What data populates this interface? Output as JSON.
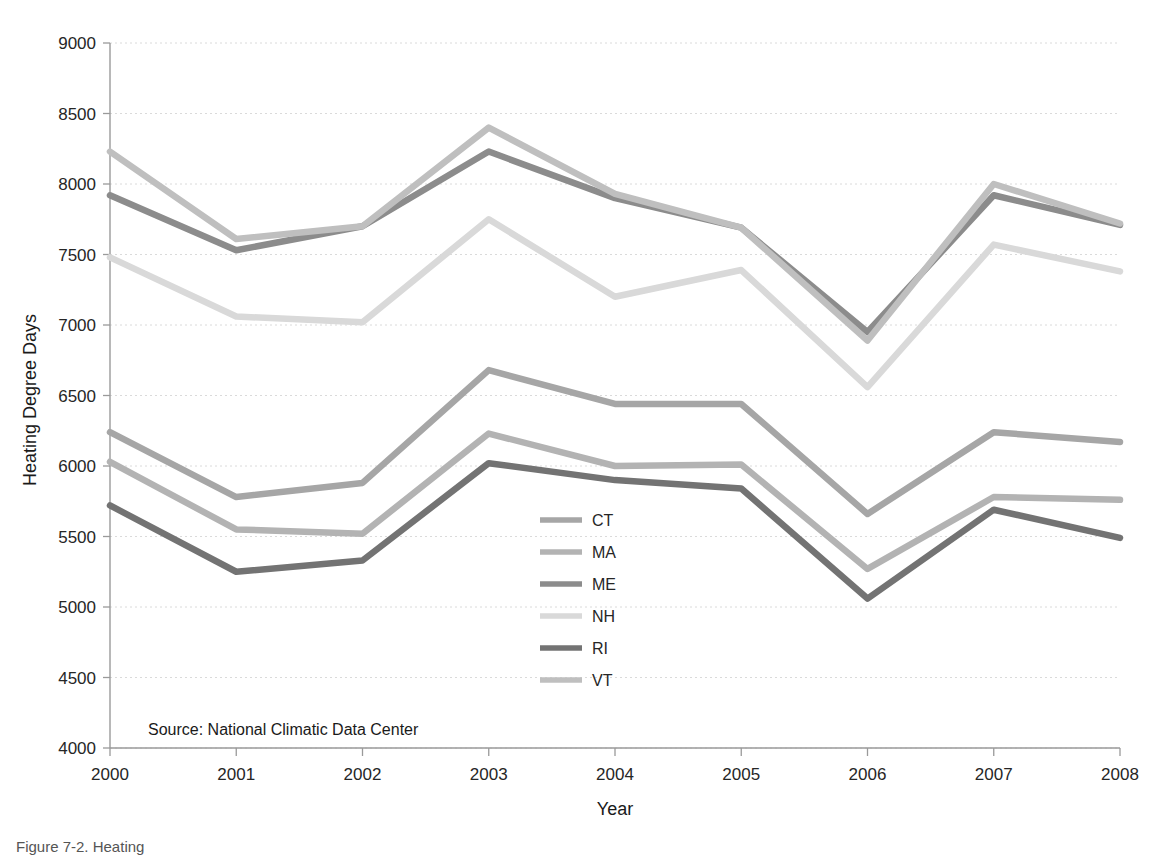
{
  "chart_data": {
    "type": "line",
    "title": "",
    "xlabel": "Year",
    "ylabel": "Heating Degree Days",
    "x": [
      2000,
      2001,
      2002,
      2003,
      2004,
      2005,
      2006,
      2007,
      2008
    ],
    "categories": [
      "2000",
      "2001",
      "2002",
      "2003",
      "2004",
      "2005",
      "2006",
      "2007",
      "2008"
    ],
    "xlim": [
      2000,
      2008
    ],
    "ylim": [
      4000,
      9000
    ],
    "yticks": [
      4000,
      4500,
      5000,
      5500,
      6000,
      6500,
      7000,
      7500,
      8000,
      8500,
      9000
    ],
    "ytick_labels": [
      "4000",
      "4500",
      "5000",
      "5500",
      "6000",
      "6500",
      "7000",
      "7500",
      "8000",
      "8500",
      "9000"
    ],
    "grid": true,
    "grid_axis": "y",
    "legend_position": "center",
    "series": [
      {
        "name": "CT",
        "color": "#a6a6a6",
        "values": [
          6240,
          5780,
          5880,
          6680,
          6440,
          6440,
          5660,
          6240,
          6170
        ]
      },
      {
        "name": "MA",
        "color": "#b3b3b3",
        "values": [
          6030,
          5550,
          5520,
          6230,
          6000,
          6010,
          5270,
          5780,
          5760
        ]
      },
      {
        "name": "ME",
        "color": "#8c8c8c",
        "values": [
          7920,
          7530,
          7700,
          8230,
          7900,
          7690,
          6950,
          7920,
          7710
        ]
      },
      {
        "name": "NH",
        "color": "#d9d9d9",
        "values": [
          7480,
          7060,
          7020,
          7750,
          7200,
          7390,
          6560,
          7570,
          7380
        ]
      },
      {
        "name": "RI",
        "color": "#737373",
        "values": [
          5720,
          5250,
          5330,
          6020,
          5900,
          5840,
          5060,
          5690,
          5490
        ]
      },
      {
        "name": "VT",
        "color": "#bfbfbf",
        "values": [
          8230,
          7610,
          7700,
          8400,
          7930,
          7690,
          6890,
          8000,
          7720
        ]
      }
    ],
    "annotations": [
      {
        "name": "source-note",
        "text": "Source: National Climatic Data Center"
      }
    ]
  },
  "legend": {
    "entries": [
      {
        "label": "CT",
        "color": "#a6a6a6"
      },
      {
        "label": "MA",
        "color": "#b3b3b3"
      },
      {
        "label": "ME",
        "color": "#8c8c8c"
      },
      {
        "label": "NH",
        "color": "#d9d9d9"
      },
      {
        "label": "RI",
        "color": "#737373"
      },
      {
        "label": "VT",
        "color": "#bfbfbf"
      }
    ]
  },
  "axes": {
    "y_title": "Heating Degree Days",
    "x_title": "Year"
  },
  "source": {
    "text": "Source: National Climatic Data Center"
  },
  "caption": {
    "text": "Figure 7-2. Heating"
  },
  "colors": {
    "axis": "#9a9a9a",
    "grid": "#d6d6d6",
    "text": "#231f20",
    "background": "#ffffff"
  }
}
